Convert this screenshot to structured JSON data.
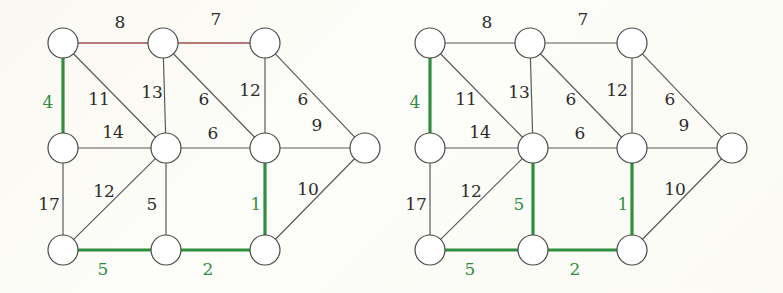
{
  "figure": {
    "type": "graph-pair-diagram",
    "background_color": "#fbfaf5",
    "node_fill": "#ffffff",
    "node_stroke": "#4a4a4a",
    "edge_color": "#5a5a5a",
    "highlight_color": "#2f8f3f",
    "accent_color": "#a05050",
    "node_radius": 15
  },
  "graphs": [
    {
      "id": "left-graph",
      "name": "left-weighted-graph",
      "offset_x": 0,
      "nodes": [
        {
          "id": "n1",
          "name": "node-top-left",
          "x": 63,
          "y": 43
        },
        {
          "id": "n2",
          "name": "node-top-middle",
          "x": 163,
          "y": 43
        },
        {
          "id": "n3",
          "name": "node-top-right",
          "x": 265,
          "y": 43
        },
        {
          "id": "n4",
          "name": "node-mid-left",
          "x": 63,
          "y": 148
        },
        {
          "id": "n5",
          "name": "node-center",
          "x": 166,
          "y": 148
        },
        {
          "id": "n6",
          "name": "node-mid-right",
          "x": 265,
          "y": 148
        },
        {
          "id": "n7",
          "name": "node-far-right",
          "x": 365,
          "y": 148
        },
        {
          "id": "n8",
          "name": "node-bottom-left",
          "x": 63,
          "y": 250
        },
        {
          "id": "n9",
          "name": "node-bottom-middle",
          "x": 166,
          "y": 250
        },
        {
          "id": "n10",
          "name": "node-bottom-right",
          "x": 265,
          "y": 250
        }
      ],
      "edges": [
        {
          "from": "n1",
          "to": "n2",
          "weight": 8,
          "lx": 120,
          "ly": 28,
          "state": "accent",
          "label_color": "dark"
        },
        {
          "from": "n2",
          "to": "n3",
          "weight": 7,
          "lx": 216,
          "ly": 25,
          "state": "accent",
          "label_color": "dark"
        },
        {
          "from": "n1",
          "to": "n4",
          "weight": 4,
          "lx": 48,
          "ly": 108,
          "state": "highlight",
          "label_color": "green"
        },
        {
          "from": "n1",
          "to": "n5",
          "weight": 11,
          "lx": 99,
          "ly": 105,
          "state": "normal",
          "label_color": "dark"
        },
        {
          "from": "n2",
          "to": "n5",
          "weight": 13,
          "lx": 152,
          "ly": 98,
          "state": "normal",
          "label_color": "dark"
        },
        {
          "from": "n2",
          "to": "n6",
          "weight": 6,
          "lx": 204,
          "ly": 105,
          "state": "normal",
          "label_color": "dark"
        },
        {
          "from": "n3",
          "to": "n6",
          "weight": 12,
          "lx": 250,
          "ly": 96,
          "state": "normal",
          "label_color": "dark"
        },
        {
          "from": "n3",
          "to": "n7",
          "weight": 6,
          "lx": 303,
          "ly": 105,
          "state": "normal",
          "label_color": "dark"
        },
        {
          "from": "n4",
          "to": "n5",
          "weight": 14,
          "lx": 113,
          "ly": 138,
          "state": "normal",
          "label_color": "dark"
        },
        {
          "from": "n5",
          "to": "n6",
          "weight": 6,
          "lx": 213,
          "ly": 139,
          "state": "normal",
          "label_color": "dark"
        },
        {
          "from": "n6",
          "to": "n7",
          "weight": 9,
          "lx": 317,
          "ly": 131,
          "state": "normal",
          "label_color": "dark"
        },
        {
          "from": "n4",
          "to": "n8",
          "weight": 17,
          "lx": 49,
          "ly": 210,
          "state": "normal",
          "label_color": "dark"
        },
        {
          "from": "n5",
          "to": "n8",
          "weight": 12,
          "lx": 104,
          "ly": 197,
          "state": "normal",
          "label_color": "dark"
        },
        {
          "from": "n5",
          "to": "n9",
          "weight": 5,
          "lx": 152,
          "ly": 210,
          "state": "normal",
          "label_color": "dark"
        },
        {
          "from": "n6",
          "to": "n10",
          "weight": 1,
          "lx": 256,
          "ly": 210,
          "state": "highlight",
          "label_color": "green"
        },
        {
          "from": "n7",
          "to": "n10",
          "weight": 10,
          "lx": 308,
          "ly": 195,
          "state": "normal",
          "label_color": "dark"
        },
        {
          "from": "n8",
          "to": "n9",
          "weight": 5,
          "lx": 103,
          "ly": 275,
          "state": "highlight",
          "label_color": "green"
        },
        {
          "from": "n9",
          "to": "n10",
          "weight": 2,
          "lx": 208,
          "ly": 275,
          "state": "highlight",
          "label_color": "green"
        }
      ]
    },
    {
      "id": "right-graph",
      "name": "right-weighted-graph",
      "offset_x": 367,
      "nodes": [
        {
          "id": "n1",
          "name": "node-top-left",
          "x": 430,
          "y": 43
        },
        {
          "id": "n2",
          "name": "node-top-middle",
          "x": 530,
          "y": 43
        },
        {
          "id": "n3",
          "name": "node-top-right",
          "x": 632,
          "y": 43
        },
        {
          "id": "n4",
          "name": "node-mid-left",
          "x": 430,
          "y": 148
        },
        {
          "id": "n5",
          "name": "node-center",
          "x": 533,
          "y": 148
        },
        {
          "id": "n6",
          "name": "node-mid-right",
          "x": 632,
          "y": 148
        },
        {
          "id": "n7",
          "name": "node-far-right",
          "x": 732,
          "y": 148
        },
        {
          "id": "n8",
          "name": "node-bottom-left",
          "x": 430,
          "y": 250
        },
        {
          "id": "n9",
          "name": "node-bottom-middle",
          "x": 533,
          "y": 250
        },
        {
          "id": "n10",
          "name": "node-bottom-right",
          "x": 632,
          "y": 250
        }
      ],
      "edges": [
        {
          "from": "n1",
          "to": "n2",
          "weight": 8,
          "lx": 487,
          "ly": 28,
          "state": "normal",
          "label_color": "dark"
        },
        {
          "from": "n2",
          "to": "n3",
          "weight": 7,
          "lx": 583,
          "ly": 25,
          "state": "normal",
          "label_color": "dark"
        },
        {
          "from": "n1",
          "to": "n4",
          "weight": 4,
          "lx": 415,
          "ly": 108,
          "state": "highlight",
          "label_color": "green"
        },
        {
          "from": "n1",
          "to": "n5",
          "weight": 11,
          "lx": 466,
          "ly": 105,
          "state": "normal",
          "label_color": "dark"
        },
        {
          "from": "n2",
          "to": "n5",
          "weight": 13,
          "lx": 519,
          "ly": 98,
          "state": "normal",
          "label_color": "dark"
        },
        {
          "from": "n2",
          "to": "n6",
          "weight": 6,
          "lx": 571,
          "ly": 105,
          "state": "normal",
          "label_color": "dark"
        },
        {
          "from": "n3",
          "to": "n6",
          "weight": 12,
          "lx": 617,
          "ly": 96,
          "state": "normal",
          "label_color": "dark"
        },
        {
          "from": "n3",
          "to": "n7",
          "weight": 6,
          "lx": 670,
          "ly": 105,
          "state": "normal",
          "label_color": "dark"
        },
        {
          "from": "n4",
          "to": "n5",
          "weight": 14,
          "lx": 480,
          "ly": 138,
          "state": "normal",
          "label_color": "dark"
        },
        {
          "from": "n5",
          "to": "n6",
          "weight": 6,
          "lx": 580,
          "ly": 139,
          "state": "normal",
          "label_color": "dark"
        },
        {
          "from": "n6",
          "to": "n7",
          "weight": 9,
          "lx": 684,
          "ly": 131,
          "state": "normal",
          "label_color": "dark"
        },
        {
          "from": "n4",
          "to": "n8",
          "weight": 17,
          "lx": 416,
          "ly": 210,
          "state": "normal",
          "label_color": "dark"
        },
        {
          "from": "n5",
          "to": "n8",
          "weight": 12,
          "lx": 471,
          "ly": 197,
          "state": "normal",
          "label_color": "dark"
        },
        {
          "from": "n5",
          "to": "n9",
          "weight": 5,
          "lx": 519,
          "ly": 210,
          "state": "highlight",
          "label_color": "green"
        },
        {
          "from": "n6",
          "to": "n10",
          "weight": 1,
          "lx": 623,
          "ly": 210,
          "state": "highlight",
          "label_color": "green"
        },
        {
          "from": "n7",
          "to": "n10",
          "weight": 10,
          "lx": 675,
          "ly": 195,
          "state": "normal",
          "label_color": "dark"
        },
        {
          "from": "n8",
          "to": "n9",
          "weight": 5,
          "lx": 470,
          "ly": 275,
          "state": "highlight",
          "label_color": "green"
        },
        {
          "from": "n9",
          "to": "n10",
          "weight": 2,
          "lx": 575,
          "ly": 275,
          "state": "highlight",
          "label_color": "green"
        }
      ]
    }
  ]
}
